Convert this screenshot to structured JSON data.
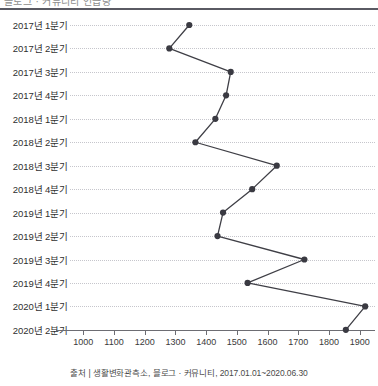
{
  "title_clipped": "블로그 · 커뮤니티 언급량",
  "caption": "출처 | 생활변화관측소, 블로그 · 커뮤니티, 2017.01.01~2020.06.30",
  "colors": {
    "line": "#3f3f46",
    "marker": "#3a3a42",
    "grid": "#c6c6cc",
    "axis": "#6d6d73",
    "rule": "#5a5a63",
    "text": "#2f2f2f"
  },
  "chart_data": {
    "type": "line",
    "orientation": "horizontal-value-axis",
    "title": "",
    "xlabel": "",
    "ylabel": "",
    "xlim": [
      950,
      1950
    ],
    "grid": true,
    "legend": false,
    "categories": [
      "2017년 1분기",
      "2017년 2분기",
      "2017년 3분기",
      "2017년 4분기",
      "2018년 1분기",
      "2018년 2분기",
      "2018년 3분기",
      "2018년 4분기",
      "2019년 1분기",
      "2019년 2분기",
      "2019년 3분기",
      "2019년 4분기",
      "2020년 1분기",
      "2020년 2분기"
    ],
    "values": [
      1345,
      1280,
      1480,
      1465,
      1430,
      1365,
      1630,
      1550,
      1455,
      1437,
      1720,
      1535,
      1918,
      1855
    ],
    "xticks": [
      1000,
      1100,
      1200,
      1300,
      1400,
      1500,
      1600,
      1700,
      1800,
      1900
    ],
    "xticklabels": [
      "1000",
      "1100",
      "1200",
      "1300",
      "1400",
      "1500",
      "1600",
      "1700",
      "1800",
      "1900"
    ]
  }
}
